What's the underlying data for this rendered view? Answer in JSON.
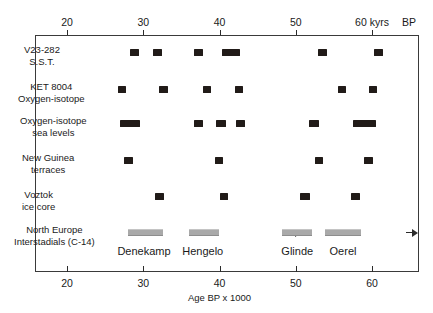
{
  "chart_data": {
    "type": "scatter",
    "title": "",
    "xlabel": "Age BP x 1000",
    "top_axis_unit": "kyrs",
    "top_axis_suffix": "BP",
    "xlim": [
      14,
      64
    ],
    "grid": false,
    "legend": "none",
    "axis_ticks": [
      20,
      30,
      40,
      50,
      60
    ],
    "top_tick_labels": [
      "20",
      "30",
      "40",
      "50",
      "60 kyrs",
      "BP"
    ],
    "bottom_tick_labels": [
      "20",
      "30",
      "40",
      "50",
      "60"
    ],
    "marker_color": "#211b18",
    "bar_color": "#a9a9a9",
    "frame_color": "#3a3a3a",
    "series": [
      {
        "name": "V23-282 S.S.T.",
        "label_lines": [
          "V23-282",
          "S.S.T."
        ],
        "values": [
          {
            "start": 28.3,
            "end": 29.4
          },
          {
            "start": 31.3,
            "end": 32.4
          },
          {
            "start": 36.7,
            "end": 37.8
          },
          {
            "start": 40.3,
            "end": 42.7
          },
          {
            "start": 52.9,
            "end": 54.1
          },
          {
            "start": 60.3,
            "end": 61.4
          }
        ]
      },
      {
        "name": "KET 8004 Oxygen-isotope",
        "label_lines": [
          "KET 8004",
          "Oxygen-isotope"
        ],
        "values": [
          {
            "start": 26.7,
            "end": 27.8
          },
          {
            "start": 32.1,
            "end": 33.2
          },
          {
            "start": 37.8,
            "end": 38.9
          },
          {
            "start": 42.0,
            "end": 43.1
          },
          {
            "start": 55.5,
            "end": 56.6
          },
          {
            "start": 59.6,
            "end": 60.7
          }
        ]
      },
      {
        "name": "Oxygen-isotope sea levels",
        "label_lines": [
          "Oxygen-isotope",
          "sea levels"
        ],
        "values": [
          {
            "start": 26.9,
            "end": 29.6
          },
          {
            "start": 36.6,
            "end": 37.9
          },
          {
            "start": 39.6,
            "end": 40.8
          },
          {
            "start": 42.2,
            "end": 43.4
          },
          {
            "start": 51.7,
            "end": 53.1
          },
          {
            "start": 57.5,
            "end": 60.5
          }
        ]
      },
      {
        "name": "New Guinea terraces",
        "label_lines": [
          "New Guinea",
          "terraces"
        ],
        "values": [
          {
            "start": 27.5,
            "end": 28.6
          },
          {
            "start": 39.4,
            "end": 40.5
          },
          {
            "start": 52.5,
            "end": 53.6
          },
          {
            "start": 59.0,
            "end": 60.1
          }
        ]
      },
      {
        "name": "Voztok ice core",
        "label_lines": [
          "Voztok",
          "ice core"
        ],
        "values": [
          {
            "start": 31.5,
            "end": 32.7
          },
          {
            "start": 40.0,
            "end": 41.1
          },
          {
            "start": 50.5,
            "end": 51.9
          },
          {
            "start": 57.3,
            "end": 58.4
          }
        ]
      }
    ],
    "interstadials": {
      "row_label_lines": [
        "North Europe",
        "Interstadials (C-14)"
      ],
      "items": [
        {
          "name": "Denekamp",
          "start": 28.0,
          "end": 32.6,
          "label_x": 30.1
        },
        {
          "name": "Hengelo",
          "start": 36.0,
          "end": 39.9,
          "label_x": 37.8
        },
        {
          "name": "Glinde",
          "start": 48.2,
          "end": 52.1,
          "label_x": 50.2
        },
        {
          "name": "Oerel",
          "start": 53.8,
          "end": 58.5,
          "label_x": 56.2
        }
      ]
    }
  }
}
